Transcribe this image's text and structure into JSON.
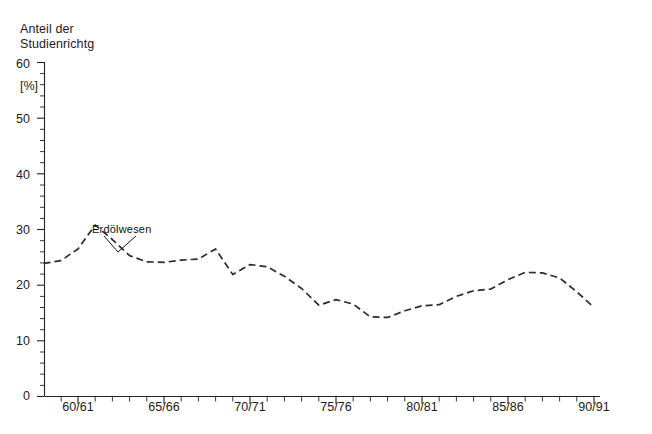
{
  "chart_data": {
    "type": "line",
    "title": "Anteil der Studienrichtg",
    "title_line1": "Anteil der",
    "title_line2": "Studienrichtg",
    "unit_label": "[%]",
    "xlabel": "",
    "ylabel": "",
    "ylim": [
      0,
      60
    ],
    "grid": false,
    "legend_position": "inline-annotation",
    "y_ticks": [
      "0",
      "10",
      "20",
      "30",
      "40",
      "50",
      "60"
    ],
    "y_tick_values": [
      0,
      10,
      20,
      30,
      40,
      50,
      60
    ],
    "y_minor_tick_interval": 2,
    "x_ticks": [
      "60/61",
      "65/66",
      "70/71",
      "75/76",
      "80/81",
      "85/86",
      "90/91"
    ],
    "x_tick_values": [
      1960,
      1965,
      1970,
      1975,
      1980,
      1985,
      1990
    ],
    "x_minor_tick_interval": 1,
    "xlim": [
      1957.5,
      1990.5
    ],
    "line_style": "dashed",
    "line_color": "#2b2b2b",
    "annotations": [
      {
        "text": "Erdölwesen",
        "x": 1962.0,
        "y": 29.5,
        "leader_to_x": 1962.7,
        "leader_to_y": 25.4
      }
    ],
    "series": [
      {
        "name": "Erdölwesen",
        "x": [
          1958,
          1959,
          1960,
          1961,
          1962,
          1963,
          1964,
          1965,
          1966,
          1967,
          1968,
          1969,
          1970,
          1971,
          1972,
          1973,
          1974,
          1975,
          1976,
          1977,
          1978,
          1979,
          1980,
          1981,
          1982,
          1983,
          1984,
          1985,
          1986,
          1987,
          1988
        ],
        "x_labels": [
          "58/59",
          "59/60",
          "60/61",
          "61/62",
          "62/63",
          "63/64",
          "64/65",
          "65/66",
          "66/67",
          "67/68",
          "68/69",
          "69/70",
          "70/71",
          "71/72",
          "72/73",
          "73/74",
          "74/75",
          "75/76",
          "76/77",
          "77/78",
          "78/79",
          "79/80",
          "80/81",
          "81/82",
          "82/83",
          "83/84",
          "84/85",
          "85/86",
          "86/87",
          "87/88",
          "88/89"
        ],
        "values": [
          23.9,
          24.4,
          26.5,
          30.8,
          28.2,
          25.3,
          24.2,
          24.1,
          24.5,
          24.7,
          26.5,
          21.9,
          23.7,
          23.3,
          21.6,
          19.4,
          16.4,
          17.4,
          16.6,
          14.3,
          14.2,
          15.4,
          16.3,
          16.5,
          18.0,
          19.0,
          19.3,
          21.0,
          22.3,
          22.2,
          21.3
        ],
        "values_tail_x": [
          1989,
          1990
        ],
        "values_tail": [
          18.8,
          16.0
        ]
      }
    ]
  }
}
